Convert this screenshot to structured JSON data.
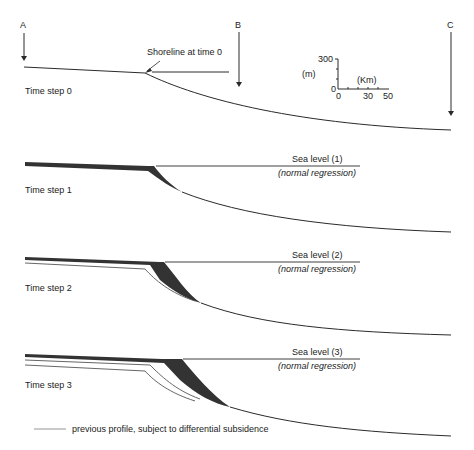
{
  "arrows": [
    {
      "label": "A"
    },
    {
      "label": "B"
    },
    {
      "label": "C"
    }
  ],
  "scale_bar": {
    "y_unit": "(m)",
    "y_ticks": [
      "300",
      "0"
    ],
    "x_unit": "(Km)",
    "x_ticks": [
      "0",
      "30",
      "50"
    ]
  },
  "panels": [
    {
      "title": "Time step 0",
      "annotation": "Shoreline at time 0"
    },
    {
      "title": "Time step 1",
      "sea_level": "Sea level (1)",
      "note": "(normal regression)"
    },
    {
      "title": "Time step 2",
      "sea_level": "Sea level (2)",
      "note": "(normal regression)"
    },
    {
      "title": "Time step 3",
      "sea_level": "Sea level (3)",
      "note": "(normal regression)"
    }
  ],
  "legend": {
    "text": "previous profile, subject to differential subsidence"
  },
  "colors": {
    "line": "#2a2a2a",
    "wedge": "#333333",
    "previous_profile": "#555555"
  }
}
